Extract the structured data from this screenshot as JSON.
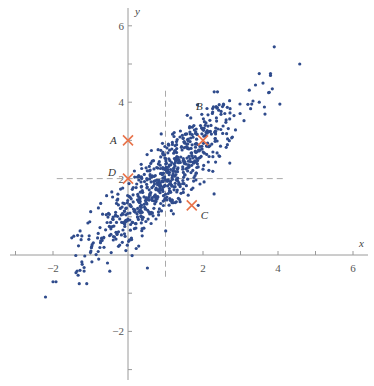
{
  "chart_data": {
    "type": "scatter",
    "title": "",
    "xlabel": "x",
    "ylabel": "y",
    "xlim": [
      -3.3,
      6.4
    ],
    "ylim": [
      -3.3,
      6.5
    ],
    "grid": false,
    "legend": null,
    "x_ticks": [
      -2,
      2,
      4,
      6
    ],
    "y_ticks": [
      -2,
      2,
      4,
      6
    ],
    "x_minor_ticks": [
      -3,
      -1,
      1,
      3,
      5
    ],
    "y_minor_ticks": [
      -3,
      -1,
      1,
      3,
      5
    ],
    "point_color": "#2f4b8c",
    "marker_color": "#e8734a",
    "cloud": {
      "description": "bivariate normal sample",
      "n": 720,
      "mean": [
        1,
        2
      ],
      "sd": [
        1.0,
        1.0
      ],
      "correlation": 0.85,
      "seed": 12345
    },
    "outliers": [
      [
        4.58,
        5.0
      ],
      [
        3.9,
        5.45
      ],
      [
        3.5,
        4.75
      ],
      [
        3.8,
        4.75
      ],
      [
        3.8,
        4.7
      ],
      [
        3.4,
        4.45
      ],
      [
        3.6,
        4.5
      ],
      [
        3.75,
        4.25
      ],
      [
        3.3,
        3.95
      ],
      [
        3.5,
        4.0
      ],
      [
        4.05,
        3.95
      ],
      [
        -2.2,
        -1.1
      ],
      [
        -2.0,
        -0.7
      ],
      [
        -1.92,
        -0.7
      ],
      [
        -1.3,
        -0.75
      ],
      [
        -1.1,
        -0.75
      ],
      [
        -1.33,
        -0.53
      ],
      [
        -1.28,
        -0.4
      ],
      [
        -1.17,
        -0.42
      ],
      [
        -1.23,
        -0.18
      ],
      [
        -1.5,
        0.45
      ],
      [
        -1.32,
        0.24
      ],
      [
        -1.02,
        0.87
      ],
      [
        -1.23,
        0.5
      ]
    ],
    "reference_lines": [
      {
        "orientation": "vertical",
        "x": 1,
        "y_from": 4.3,
        "y_to": -0.6,
        "style": "dashed"
      },
      {
        "orientation": "horizontal",
        "y": 2,
        "x_from": -1.9,
        "x_to": 4.2,
        "style": "dashed"
      }
    ],
    "annotated_points": [
      {
        "label": "A",
        "x": 0,
        "y": 3.0,
        "label_dx": -18,
        "label_dy": 4
      },
      {
        "label": "B",
        "x": 2.0,
        "y": 3.0,
        "label_dx": -7,
        "label_dy": -30
      },
      {
        "label": "C",
        "x": 1.7,
        "y": 1.3,
        "label_dx": 9,
        "label_dy": 14
      },
      {
        "label": "D",
        "x": 0,
        "y": 2.0,
        "label_dx": -20,
        "label_dy": -3
      }
    ]
  }
}
